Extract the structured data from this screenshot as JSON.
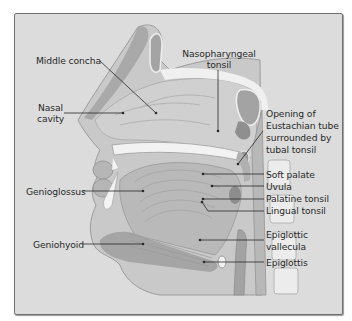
{
  "diagram": {
    "labels": {
      "middle_concha": "Middle concha",
      "nasal_cavity_1": "Nasal",
      "nasal_cavity_2": "cavity",
      "nasopharyngeal_1": "Nasopharyngeal",
      "nasopharyngeal_2": "tonsil",
      "eustachian_1": "Opening of",
      "eustachian_2": "Eustachian tube",
      "eustachian_3": "surrounded by",
      "eustachian_4": "tubal tonsil",
      "genioglossus": "Genioglossus",
      "soft_palate": "Soft palate",
      "uvula": "Uvula",
      "palatine_tonsil": "Palatine tonsil",
      "lingual_tonsil": "Lingual tonsil",
      "geniohyoid": "Geniohyoid",
      "epiglottic_vallecula_1": "Epiglottic",
      "epiglottic_vallecula_2": "vallecula",
      "epiglottis": "Epiglottis"
    },
    "colors": {
      "background": "#dcdcdc",
      "tissue_light": "#e9e9e9",
      "tissue_mid": "#c4c4c4",
      "tissue_dark": "#a8a8a8",
      "bone": "#f2f2f2",
      "leader": "#2a2a2a"
    }
  }
}
